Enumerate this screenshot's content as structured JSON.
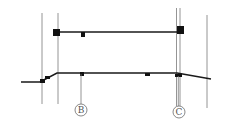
{
  "diagram": {
    "type": "architectural-section",
    "colors": {
      "background": "#ffffff",
      "slab": "#1a1a1a",
      "grid_line": "#7a7a7a",
      "bubble": "#6a6a6a"
    },
    "grid_bubbles": [
      {
        "id": "B",
        "label": "B",
        "cx": 81,
        "cy": 110,
        "r": 6
      },
      {
        "id": "C",
        "label": "C",
        "cx": 179,
        "cy": 112,
        "r": 6
      }
    ],
    "vertical_lines": [
      {
        "x": 42,
        "y1": 13,
        "y2": 104
      },
      {
        "x": 58,
        "y1": 13,
        "y2": 104
      },
      {
        "x": 176.5,
        "y1": 8,
        "y2": 106
      },
      {
        "x": 180,
        "y1": 8,
        "y2": 106
      },
      {
        "x": 207,
        "y1": 15,
        "y2": 108
      }
    ],
    "upper_slab": {
      "x1": 54,
      "y": 32,
      "x2": 184
    },
    "lower_slab_points": "21,82 40,82 57,73 177,73 211,79",
    "blocks": [
      {
        "x": 53,
        "y": 29,
        "w": 7,
        "h": 7
      },
      {
        "x": 81,
        "y": 32,
        "w": 4,
        "h": 5
      },
      {
        "x": 177,
        "y": 26,
        "w": 7,
        "h": 8
      },
      {
        "x": 40,
        "y": 79,
        "w": 5,
        "h": 4
      },
      {
        "x": 45,
        "y": 76,
        "w": 5,
        "h": 3
      },
      {
        "x": 80,
        "y": 72,
        "w": 4,
        "h": 4
      },
      {
        "x": 145,
        "y": 73,
        "w": 5,
        "h": 3
      },
      {
        "x": 175,
        "y": 74,
        "w": 7,
        "h": 3
      }
    ]
  }
}
